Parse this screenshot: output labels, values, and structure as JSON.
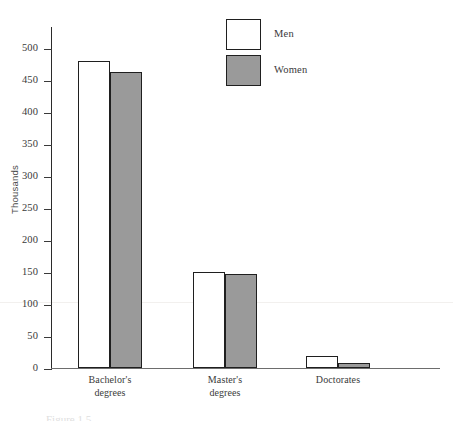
{
  "chart_data": {
    "type": "bar",
    "title": "",
    "categories": [
      "Bachelor's degrees",
      "Master's degrees",
      "Doctorates"
    ],
    "category_lines": [
      [
        "Bachelor's",
        "degrees"
      ],
      [
        "Master's",
        "degrees"
      ],
      [
        "Doctorates"
      ]
    ],
    "series": [
      {
        "name": "Men",
        "values": [
          480,
          151,
          20
        ],
        "color": "#ffffff"
      },
      {
        "name": "Women",
        "values": [
          464,
          147,
          8
        ],
        "color": "#9a9a9a"
      }
    ],
    "xlabel": "",
    "ylabel": "Thousands",
    "ylim": [
      0,
      500
    ],
    "ytick_step": 50,
    "yticks": [
      0,
      50,
      100,
      150,
      200,
      250,
      300,
      350,
      400,
      450,
      500
    ],
    "ytick_labels": [
      "0",
      "50",
      "100",
      "150",
      "200",
      "250",
      "300",
      "350",
      "400",
      "450",
      "500"
    ],
    "grid": false,
    "legend_position": "upper right",
    "legend_entries": [
      "Men",
      "Women"
    ]
  },
  "axis": {
    "y_title": "Thousands"
  },
  "legend": {
    "items": [
      {
        "label": "Men",
        "swatch": "white-swatch"
      },
      {
        "label": "Women",
        "swatch": "gray-swatch"
      }
    ]
  },
  "caption": {
    "text": "Figure 1.5"
  }
}
